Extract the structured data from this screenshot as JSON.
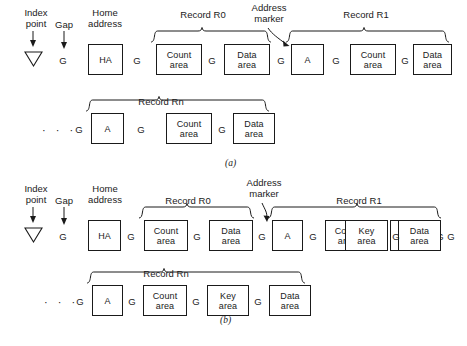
{
  "figure": {
    "labels": {
      "index_point": "Index\npoint",
      "index_point_line1": "Index",
      "index_point_line2": "point",
      "gap": "Gap",
      "home_address_line1": "Home",
      "home_address_line2": "address",
      "address_marker_line1": "Address",
      "address_marker_line2": "marker",
      "record_r0": "Record R0",
      "record_r1": "Record R1",
      "record_rn": "Record Rn",
      "ellipsis": "· · ·",
      "gap_letter": "G"
    },
    "box_text": {
      "home_address": "HA",
      "address_marker": "A",
      "count_line1": "Count",
      "count_line2": "area",
      "key_line1": "Key",
      "key_line2": "area",
      "data_line1": "Data",
      "data_line2": "area"
    },
    "panels": [
      {
        "id": "a",
        "sublabel": "(a)",
        "format_name": "Count-Data format",
        "track_row": {
          "index_point": "▽",
          "sequence": [
            {
              "type": "gap",
              "label": "G"
            },
            {
              "type": "box",
              "name": "home-address-box",
              "lines": [
                "HA"
              ]
            },
            {
              "type": "gap",
              "label": "G"
            },
            {
              "type": "box",
              "name": "count-area-box",
              "lines": [
                "Count",
                "area"
              ]
            },
            {
              "type": "gap",
              "label": "G"
            },
            {
              "type": "box",
              "name": "data-area-box",
              "lines": [
                "Data",
                "area"
              ]
            },
            {
              "type": "gap",
              "label": "G"
            },
            {
              "type": "box",
              "name": "address-marker-box",
              "lines": [
                "A"
              ]
            },
            {
              "type": "gap",
              "label": "G"
            },
            {
              "type": "box",
              "name": "count-area-box",
              "lines": [
                "Count",
                "area"
              ]
            },
            {
              "type": "gap",
              "label": "G"
            },
            {
              "type": "box",
              "name": "data-area-box",
              "lines": [
                "Data",
                "area"
              ]
            },
            {
              "type": "gap",
              "label": "G"
            }
          ]
        },
        "rn_row": {
          "leading_ellipsis": "· · ·",
          "sequence": [
            {
              "type": "gap",
              "label": "G"
            },
            {
              "type": "box",
              "name": "address-marker-box",
              "lines": [
                "A"
              ]
            },
            {
              "type": "gap",
              "label": "G"
            },
            {
              "type": "box",
              "name": "count-area-box",
              "lines": [
                "Count",
                "area"
              ]
            },
            {
              "type": "gap",
              "label": "G"
            },
            {
              "type": "box",
              "name": "data-area-box",
              "lines": [
                "Data",
                "area"
              ]
            }
          ]
        }
      },
      {
        "id": "b",
        "sublabel": "(b)",
        "format_name": "Count-Key-Data format",
        "track_row": {
          "index_point": "▽",
          "sequence": [
            {
              "type": "gap",
              "label": "G"
            },
            {
              "type": "box",
              "name": "home-address-box",
              "lines": [
                "HA"
              ]
            },
            {
              "type": "gap",
              "label": "G"
            },
            {
              "type": "box",
              "name": "count-area-box",
              "lines": [
                "Count",
                "area"
              ]
            },
            {
              "type": "gap",
              "label": "G"
            },
            {
              "type": "box",
              "name": "data-area-box",
              "lines": [
                "Data",
                "area"
              ]
            },
            {
              "type": "gap",
              "label": "G"
            },
            {
              "type": "box",
              "name": "address-marker-box",
              "lines": [
                "A"
              ]
            },
            {
              "type": "gap",
              "label": "G"
            },
            {
              "type": "box",
              "name": "count-area-box",
              "lines": [
                "Count",
                "area"
              ]
            },
            {
              "type": "gap",
              "label": "G"
            },
            {
              "type": "box",
              "name": "key-area-box",
              "lines": [
                "Key",
                "area"
              ]
            },
            {
              "type": "gap",
              "label": "G"
            },
            {
              "type": "box",
              "name": "data-area-box",
              "lines": [
                "Data",
                "area"
              ]
            },
            {
              "type": "gap",
              "label": "G"
            }
          ]
        },
        "rn_row": {
          "leading_ellipsis": "· · ·",
          "sequence": [
            {
              "type": "gap",
              "label": "G"
            },
            {
              "type": "box",
              "name": "address-marker-box",
              "lines": [
                "A"
              ]
            },
            {
              "type": "gap",
              "label": "G"
            },
            {
              "type": "box",
              "name": "count-area-box",
              "lines": [
                "Count",
                "area"
              ]
            },
            {
              "type": "gap",
              "label": "G"
            },
            {
              "type": "box",
              "name": "key-area-box",
              "lines": [
                "Key",
                "area"
              ]
            },
            {
              "type": "gap",
              "label": "G"
            },
            {
              "type": "box",
              "name": "data-area-box",
              "lines": [
                "Data",
                "area"
              ]
            }
          ]
        }
      }
    ],
    "colors": {
      "ink": "#1a1a1a",
      "background": "#ffffff"
    }
  }
}
